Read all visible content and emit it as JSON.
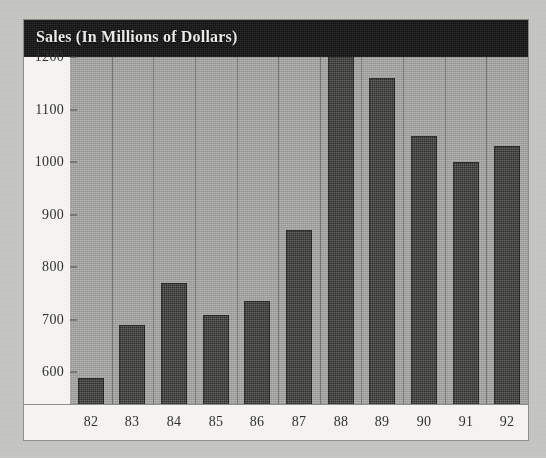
{
  "chart_data": {
    "type": "bar",
    "title": "Sales (In Millions of Dollars)",
    "title_bold_part": "Sales",
    "title_rest": " (In Millions of Dollars)",
    "xlabel": "",
    "ylabel": "",
    "categories": [
      "82",
      "83",
      "84",
      "85",
      "86",
      "87",
      "88",
      "89",
      "90",
      "91",
      "92"
    ],
    "values": [
      590,
      690,
      770,
      710,
      735,
      870,
      1210,
      1160,
      1050,
      1000,
      1030
    ],
    "ylim": [
      500,
      1200
    ],
    "ytick_values": [
      500,
      600,
      700,
      800,
      900,
      1000,
      1100,
      1200
    ],
    "ytick_labels": [
      "500",
      "600",
      "700",
      "800",
      "900",
      "1000",
      "1100",
      "1200"
    ],
    "grid": "vertical-category-separators",
    "legend": "none",
    "series": [
      {
        "name": "Sales",
        "values": [
          590,
          690,
          770,
          710,
          735,
          870,
          1210,
          1160,
          1050,
          1000,
          1030
        ]
      }
    ],
    "colors": {
      "title_bar_background": "#171717",
      "title_text": "#f2f0ec",
      "plot_background": "#a9a9a5",
      "bar_fill": "#4b4b49",
      "gridline": "#6e6e6b",
      "label_strip_background": "#f4f3f0",
      "label_text": "#30302e",
      "page_background": "#c9c9c6"
    }
  }
}
